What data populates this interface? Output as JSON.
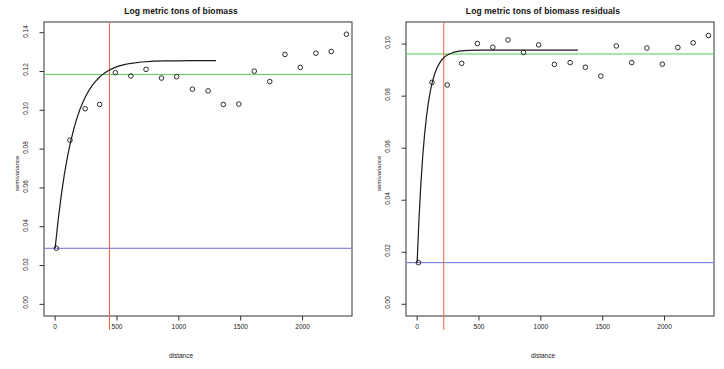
{
  "figure": {
    "width": 724,
    "height": 369,
    "background": "#ffffff",
    "panel_count": 2
  },
  "colors": {
    "point_stroke": "#222222",
    "model_curve": "#1a1a1a",
    "sill_line": "#55cc55",
    "nugget_line": "#6a6ad8",
    "range_line": "#e8683c",
    "axis": "#333333",
    "text": "#1a1a1a"
  },
  "chart_data": [
    {
      "type": "scatter",
      "panel": "left",
      "title": "Log metric tons of biomass",
      "xlabel": "distance",
      "ylabel": "semivariance",
      "xlim": [
        -90,
        2400
      ],
      "ylim": [
        -0.006,
        0.1455
      ],
      "xticks": [
        0,
        500,
        1000,
        1500,
        2000
      ],
      "xticklabels": [
        "0",
        "500",
        "1000",
        "1500",
        "2000"
      ],
      "yticks": [
        0.0,
        0.02,
        0.04,
        0.06,
        0.08,
        0.1,
        0.12,
        0.14
      ],
      "yticklabels": [
        "0.00",
        "0.02",
        "0.04",
        "0.06",
        "0.08",
        "0.10",
        "0.12",
        "0.14"
      ],
      "grid": false,
      "legend": "none",
      "x": [
        10,
        120,
        243,
        360,
        487,
        612,
        735,
        860,
        982,
        1110,
        1237,
        1360,
        1485,
        1610,
        1735,
        1858,
        1982,
        2108,
        2232,
        2355
      ],
      "y": [
        0.0289,
        0.0846,
        0.1008,
        0.103,
        0.1194,
        0.1177,
        0.1211,
        0.1166,
        0.1173,
        0.1109,
        0.11,
        0.103,
        0.1032,
        0.1202,
        0.1148,
        0.1288,
        0.1221,
        0.1294,
        0.1303,
        0.1392
      ],
      "model": {
        "name": "exponential-variogram",
        "nugget": 0.0289,
        "sill": 0.1185,
        "range": 440,
        "curve_x": [
          0,
          25,
          50,
          75,
          100,
          125,
          150,
          175,
          200,
          225,
          250,
          275,
          300,
          325,
          350,
          375,
          400,
          425,
          450,
          500,
          550,
          600,
          700,
          800,
          900,
          1000,
          1100,
          1200,
          1300
        ],
        "curve_y": [
          0.0289,
          0.0438,
          0.0564,
          0.0671,
          0.0761,
          0.0838,
          0.0902,
          0.0957,
          0.1004,
          0.1043,
          0.1076,
          0.1104,
          0.1128,
          0.1148,
          0.1165,
          0.118,
          0.1192,
          0.1203,
          0.1211,
          0.1225,
          0.1234,
          0.1241,
          0.1249,
          0.1253,
          0.1255,
          0.1255,
          0.1256,
          0.1256,
          0.1256
        ]
      },
      "reference_lines": [
        {
          "name": "sill-line",
          "orientation": "horizontal",
          "value": 0.1185,
          "color": "#55cc55"
        },
        {
          "name": "nugget-line",
          "orientation": "horizontal",
          "value": 0.0289,
          "color": "#6a6ad8"
        },
        {
          "name": "range-line",
          "orientation": "vertical",
          "value": 440,
          "color": "#e8683c"
        }
      ]
    },
    {
      "type": "scatter",
      "panel": "right",
      "title": "Log metric tons of biomass residuals",
      "xlabel": "distance",
      "ylabel": "semivariance",
      "xlim": [
        -90,
        2400
      ],
      "ylim": [
        -0.0045,
        0.1085
      ],
      "xticks": [
        0,
        500,
        1000,
        1500,
        2000
      ],
      "xticklabels": [
        "0",
        "500",
        "1000",
        "1500",
        "2000"
      ],
      "yticks": [
        0.0,
        0.02,
        0.04,
        0.06,
        0.08,
        0.1
      ],
      "yticklabels": [
        "0.00",
        "0.02",
        "0.04",
        "0.06",
        "0.08",
        "0.10"
      ],
      "grid": false,
      "legend": "none",
      "x": [
        10,
        120,
        243,
        360,
        487,
        612,
        735,
        860,
        982,
        1110,
        1237,
        1360,
        1485,
        1610,
        1735,
        1858,
        1982,
        2108,
        2232,
        2355
      ],
      "y": [
        0.016,
        0.0853,
        0.0843,
        0.0926,
        0.1002,
        0.0988,
        0.1016,
        0.0968,
        0.0997,
        0.0922,
        0.0929,
        0.0911,
        0.0877,
        0.0993,
        0.0929,
        0.0985,
        0.0923,
        0.0987,
        0.1005,
        0.1033
      ],
      "model": {
        "name": "exponential-variogram",
        "nugget": 0.016,
        "sill": 0.0962,
        "range": 215,
        "curve_x": [
          0,
          15,
          30,
          45,
          60,
          75,
          90,
          105,
          120,
          140,
          160,
          180,
          200,
          220,
          240,
          260,
          280,
          300,
          340,
          380,
          420,
          500,
          600,
          700,
          800,
          900,
          1000,
          1100,
          1200,
          1300
        ],
        "curve_y": [
          0.016,
          0.0328,
          0.0461,
          0.0567,
          0.0652,
          0.0719,
          0.0772,
          0.0815,
          0.0849,
          0.0883,
          0.0908,
          0.0926,
          0.094,
          0.095,
          0.0957,
          0.0962,
          0.0966,
          0.0969,
          0.0973,
          0.0975,
          0.0976,
          0.0977,
          0.0977,
          0.0977,
          0.0977,
          0.0977,
          0.0977,
          0.0977,
          0.0977,
          0.0977
        ]
      },
      "reference_lines": [
        {
          "name": "sill-line",
          "orientation": "horizontal",
          "value": 0.0962,
          "color": "#55cc55"
        },
        {
          "name": "nugget-line",
          "orientation": "horizontal",
          "value": 0.016,
          "color": "#6a6ad8"
        },
        {
          "name": "range-line",
          "orientation": "vertical",
          "value": 215,
          "color": "#e8683c"
        }
      ]
    }
  ]
}
